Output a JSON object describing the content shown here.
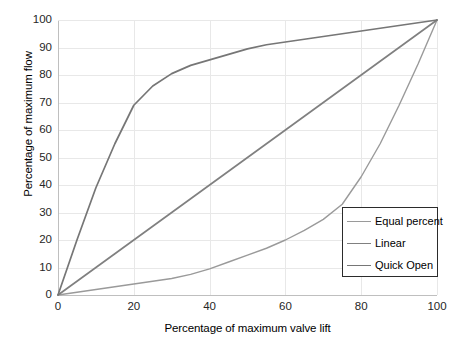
{
  "chart_data": {
    "type": "line",
    "title": "",
    "xlabel": "Percentage of maximum valve lift",
    "ylabel": "Percentage of maximum flow",
    "xlim": [
      0,
      100
    ],
    "ylim": [
      0,
      100
    ],
    "xticks": [
      0,
      20,
      40,
      60,
      80,
      100
    ],
    "yticks": [
      0,
      10,
      20,
      30,
      40,
      50,
      60,
      70,
      80,
      90,
      100
    ],
    "grid": true,
    "legend_position": "lower-right",
    "x": [
      0,
      5,
      10,
      15,
      20,
      25,
      30,
      35,
      40,
      45,
      50,
      55,
      60,
      65,
      70,
      75,
      80,
      85,
      90,
      95,
      100
    ],
    "series": [
      {
        "name": "Equal percent",
        "color": "#9a9a9a",
        "values": [
          0,
          1,
          2,
          3,
          4,
          5,
          6,
          7.5,
          9.5,
          12,
          14.5,
          17,
          20,
          23.5,
          27.5,
          33,
          43,
          55,
          69,
          84,
          100
        ]
      },
      {
        "name": "Linear",
        "color": "#808080",
        "values": [
          0,
          5,
          10,
          15,
          20,
          25,
          30,
          35,
          40,
          45,
          50,
          55,
          60,
          65,
          70,
          75,
          80,
          85,
          90,
          95,
          100
        ]
      },
      {
        "name": "Quick Open",
        "color": "#767676",
        "values": [
          0,
          20,
          39,
          55,
          69,
          76,
          80.5,
          83.5,
          85.5,
          87.5,
          89.5,
          91,
          92,
          93,
          94,
          95,
          96,
          97,
          98,
          99,
          100
        ]
      }
    ]
  },
  "axes": {
    "y_title": "Percentage of maximum flow",
    "x_title": "Percentage of maximum valve lift",
    "y_tick_labels": [
      "100",
      "90",
      "80",
      "70",
      "60",
      "50",
      "40",
      "30",
      "20",
      "10",
      "0"
    ],
    "x_tick_labels": [
      "0",
      "20",
      "40",
      "60",
      "80",
      "100"
    ]
  },
  "legend": {
    "entries": [
      {
        "label": "Equal percent",
        "color": "#9a9a9a"
      },
      {
        "label": "Linear",
        "color": "#808080"
      },
      {
        "label": "Quick Open",
        "color": "#767676"
      }
    ]
  },
  "style": {
    "grid_color": "#e8e8e8",
    "axis_color": "#bfbfbf",
    "background": "#ffffff"
  }
}
